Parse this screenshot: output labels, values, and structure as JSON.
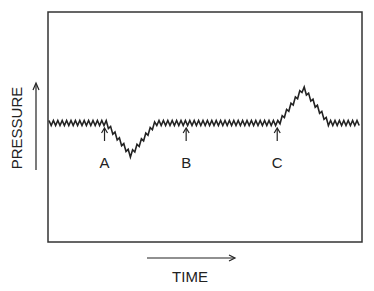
{
  "diagram": {
    "y_axis_label": "PRESSURE",
    "x_axis_label": "TIME",
    "trace_description": "Oscillating pressure baseline with a transient drop after event A and a transient rise after event C",
    "events": [
      {
        "label": "A",
        "time": 0.18,
        "effect": "dip",
        "magnitude": -0.55
      },
      {
        "label": "B",
        "time": 0.44,
        "effect": "none",
        "magnitude": 0
      },
      {
        "label": "C",
        "time": 0.73,
        "effect": "peak",
        "magnitude": 0.6
      }
    ],
    "colors": {
      "ink": "#222222",
      "background": "#ffffff"
    }
  }
}
